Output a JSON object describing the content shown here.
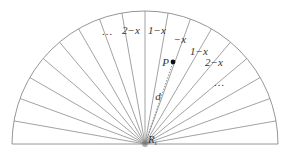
{
  "diagram": {
    "center": {
      "x": 145,
      "y": 144,
      "label": "R",
      "subscript": "t"
    },
    "radius": 133,
    "sector_degrees": 10,
    "sector_count": 18,
    "line_color": "#8a8a8a",
    "sector_labels": [
      {
        "text": "…",
        "x": 107,
        "y": 35
      },
      {
        "text": "2−x",
        "x": 131,
        "y": 34
      },
      {
        "text": "1−x",
        "x": 157,
        "y": 34
      },
      {
        "text": "−x",
        "x": 180,
        "y": 43
      },
      {
        "text": "1−x",
        "x": 199,
        "y": 55
      },
      {
        "text": "2−x",
        "x": 214,
        "y": 66
      },
      {
        "text": "…",
        "x": 219,
        "y": 86
      }
    ],
    "point": {
      "label": "P",
      "x": 173,
      "y": 62
    },
    "distance_label": "d"
  }
}
